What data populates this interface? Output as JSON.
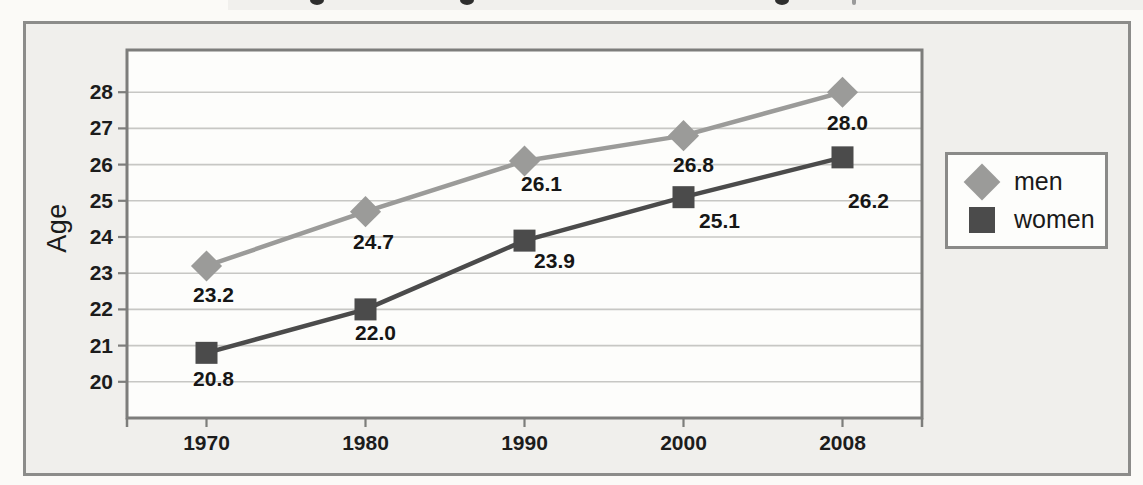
{
  "figure": {
    "y_axis_title": "Age",
    "legend": {
      "entries": [
        {
          "label": "men",
          "marker": "diamond"
        },
        {
          "label": "women",
          "marker": "square"
        }
      ]
    }
  },
  "chart_data": {
    "type": "line",
    "categories": [
      "1970",
      "1980",
      "1990",
      "2000",
      "2008"
    ],
    "series": [
      {
        "name": "men",
        "marker": "diamond",
        "color": "#9b9b99",
        "values": [
          23.2,
          24.7,
          26.1,
          26.8,
          28.0
        ],
        "point_labels": [
          "23.2",
          "24.7",
          "26.1",
          "26.8",
          "28.0"
        ]
      },
      {
        "name": "women",
        "marker": "square",
        "color": "#4b4b4b",
        "values": [
          20.8,
          22.0,
          23.9,
          25.1,
          26.2
        ],
        "point_labels": [
          "20.8",
          "22.0",
          "23.9",
          "25.1",
          "26.2"
        ]
      }
    ],
    "title": "",
    "xlabel": "",
    "ylabel": "Age",
    "ylim": [
      19,
      29.2
    ],
    "yticks": [
      20,
      21,
      22,
      23,
      24,
      25,
      26,
      27,
      28
    ],
    "grid": true,
    "legend_position": "right",
    "colors": {
      "grid": "#c7c7c4",
      "plot_border": "#7d7d7b",
      "plot_background": "#fdfdfb",
      "tick_text": "#1c1c1c",
      "data_label_text": "#161616"
    }
  }
}
